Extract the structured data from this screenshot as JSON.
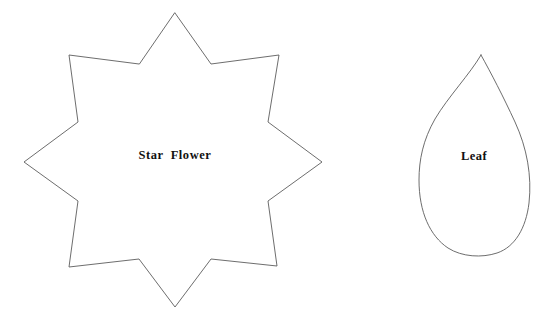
{
  "page": {
    "background_color": "#ffffff",
    "width": 543,
    "height": 311
  },
  "style": {
    "outline_color": "#5c5c5c",
    "fill_color": "#ffffff",
    "label_color": "#111111"
  },
  "shapes": [
    {
      "id": "star-flower",
      "label": "Star Flower",
      "type": "8-point-star",
      "label_x": 175,
      "label_y": 156,
      "points": "175,13 211,64 279,55 268,122 322,162 268,201 277,266 211,259 175,307 139,259 69,267 78,201 24,162 78,122 69,55 139,64",
      "bbox": {
        "x": 24,
        "y": 13,
        "width": 298,
        "height": 294
      }
    },
    {
      "id": "leaf",
      "label": "Leaf",
      "type": "leaf-teardrop",
      "label_x": 474,
      "label_y": 157,
      "path": "M 481 55 C 470 74, 448 97, 435 119 C 423 140, 419 160, 419 180 C 419 212, 430 236, 448 248 C 462 257, 482 258, 497 253 C 515 247, 526 228, 529 203 C 532 176, 527 148, 515 122 C 503 96, 491 73, 481 55 Z",
      "bbox": {
        "x": 419,
        "y": 55,
        "width": 110,
        "height": 201
      }
    }
  ]
}
